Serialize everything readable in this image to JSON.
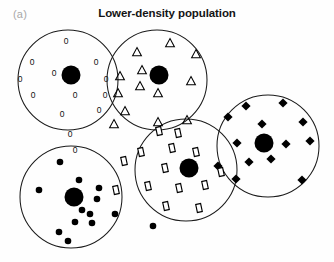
{
  "figure": {
    "panel_label": "(a)",
    "title": "Lower-density population",
    "width": 334,
    "height": 262,
    "background_color": "#fefefe",
    "stroke_color": "#1b1b1b",
    "marker_color": "#000000"
  },
  "chart_data": {
    "type": "scatter",
    "title": "Lower-density population",
    "subtitle": "",
    "panel": "(a)",
    "xlabel": "",
    "ylabel": "",
    "xlim": [
      0,
      334
    ],
    "ylim": [
      0,
      262
    ],
    "grid": false,
    "legend": "none",
    "axes_visible": false,
    "clusters": [
      {
        "id": "cluster-zero",
        "label": "0",
        "glyph": "zero",
        "cx": 68,
        "cy": 80,
        "r": 50,
        "hub": {
          "x": 71,
          "y": 75,
          "r": 9.5
        },
        "member_count": 13,
        "members": [
          {
            "x": 66,
            "y": 41
          },
          {
            "x": 32,
            "y": 62
          },
          {
            "x": 96,
            "y": 62
          },
          {
            "x": 54,
            "y": 73
          },
          {
            "x": 33,
            "y": 95
          },
          {
            "x": 75,
            "y": 95
          },
          {
            "x": 62,
            "y": 114
          },
          {
            "x": 99,
            "y": 110
          },
          {
            "x": 106,
            "y": 79
          },
          {
            "x": 105,
            "y": 95
          },
          {
            "x": 70,
            "y": 134
          },
          {
            "x": 20,
            "y": 79
          },
          {
            "x": 75,
            "y": 150
          }
        ]
      },
      {
        "id": "cluster-triangle",
        "label": "triangle",
        "glyph": "triangle",
        "cx": 157,
        "cy": 80,
        "r": 50,
        "hub": {
          "x": 159,
          "y": 75,
          "r": 9.5
        },
        "member_count": 13,
        "members": [
          {
            "x": 137,
            "y": 52
          },
          {
            "x": 170,
            "y": 43
          },
          {
            "x": 196,
            "y": 54
          },
          {
            "x": 142,
            "y": 70
          },
          {
            "x": 140,
            "y": 86
          },
          {
            "x": 158,
            "y": 93
          },
          {
            "x": 191,
            "y": 81
          },
          {
            "x": 120,
            "y": 76
          },
          {
            "x": 118,
            "y": 93
          },
          {
            "x": 125,
            "y": 111
          },
          {
            "x": 114,
            "y": 124
          },
          {
            "x": 158,
            "y": 122
          },
          {
            "x": 187,
            "y": 120
          }
        ]
      },
      {
        "id": "cluster-diamond",
        "label": "diamond",
        "glyph": "diamond",
        "cx": 268,
        "cy": 146,
        "r": 51,
        "hub": {
          "x": 264,
          "y": 143,
          "r": 9.5
        },
        "member_count": 13,
        "members": [
          {
            "x": 246,
            "y": 106
          },
          {
            "x": 283,
            "y": 103
          },
          {
            "x": 228,
            "y": 117
          },
          {
            "x": 262,
            "y": 124
          },
          {
            "x": 303,
            "y": 122
          },
          {
            "x": 237,
            "y": 143
          },
          {
            "x": 286,
            "y": 144
          },
          {
            "x": 310,
            "y": 141
          },
          {
            "x": 249,
            "y": 162
          },
          {
            "x": 271,
            "y": 159
          },
          {
            "x": 236,
            "y": 179
          },
          {
            "x": 218,
            "y": 166
          },
          {
            "x": 302,
            "y": 180
          }
        ]
      },
      {
        "id": "cluster-rectangle",
        "label": "rectangle",
        "glyph": "rect",
        "cx": 186,
        "cy": 170,
        "r": 51,
        "hub": {
          "x": 189,
          "y": 168,
          "r": 9.5
        },
        "member_count": 14,
        "members": [
          {
            "x": 159,
            "y": 131
          },
          {
            "x": 141,
            "y": 152
          },
          {
            "x": 172,
            "y": 148
          },
          {
            "x": 196,
            "y": 152
          },
          {
            "x": 124,
            "y": 161
          },
          {
            "x": 165,
            "y": 168
          },
          {
            "x": 148,
            "y": 186
          },
          {
            "x": 179,
            "y": 188
          },
          {
            "x": 205,
            "y": 185
          },
          {
            "x": 221,
            "y": 172
          },
          {
            "x": 116,
            "y": 190
          },
          {
            "x": 166,
            "y": 206
          },
          {
            "x": 199,
            "y": 208
          },
          {
            "x": 178,
            "y": 133
          }
        ]
      },
      {
        "id": "cluster-filled-dot",
        "label": "filled-dot",
        "glyph": "dot",
        "cx": 71,
        "cy": 197,
        "r": 51,
        "hub": {
          "x": 74,
          "y": 197,
          "r": 9.5
        },
        "member_count": 13,
        "members": [
          {
            "x": 60,
            "y": 162
          },
          {
            "x": 79,
            "y": 180
          },
          {
            "x": 39,
            "y": 190
          },
          {
            "x": 99,
            "y": 188
          },
          {
            "x": 97,
            "y": 199
          },
          {
            "x": 82,
            "y": 210
          },
          {
            "x": 90,
            "y": 214
          },
          {
            "x": 115,
            "y": 214
          },
          {
            "x": 75,
            "y": 222
          },
          {
            "x": 92,
            "y": 223
          },
          {
            "x": 59,
            "y": 232
          },
          {
            "x": 68,
            "y": 241
          },
          {
            "x": 153,
            "y": 226
          }
        ]
      }
    ],
    "glyph_sizes": {
      "hub_radius": 9.5,
      "dot_radius": 3.3,
      "diamond_half": 4.6,
      "triangle_half": 4.4,
      "rect_width": 5.0,
      "rect_height": 8.2,
      "zero_font_size": 8.5
    }
  }
}
